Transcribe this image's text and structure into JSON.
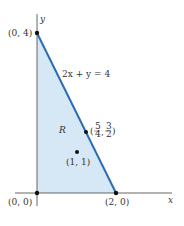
{
  "diagram": {
    "axes": {
      "x_label": "x",
      "y_label": "y"
    },
    "region": {
      "label": "R",
      "fill": "#d6e8f5"
    },
    "boundary_line": {
      "equation": "2x + y = 4",
      "color": "#2a6db5"
    },
    "points": [
      {
        "name": "origin",
        "label": "(0, 0)"
      },
      {
        "name": "y-intercept",
        "label": "(0, 4)"
      },
      {
        "name": "x-intercept",
        "label": "(2, 0)"
      },
      {
        "name": "point-on-line",
        "label_x_num": "5",
        "label_x_den": "4",
        "label_y_num": "3",
        "label_y_den": "2"
      },
      {
        "name": "interior-point",
        "label": "(1, 1)"
      }
    ]
  }
}
